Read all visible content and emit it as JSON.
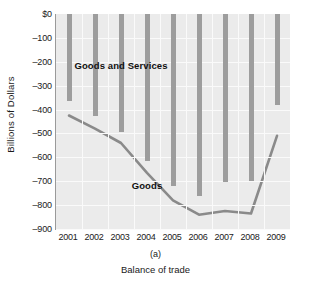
{
  "chart_data": {
    "type": "bar",
    "title": "",
    "subtitle": "",
    "panel_label": "(a)",
    "caption": "Balance of trade",
    "xlabel": "",
    "ylabel": "Billions of Dollars",
    "categories": [
      "2001",
      "2002",
      "2003",
      "2004",
      "2005",
      "2006",
      "2007",
      "2008",
      "2009"
    ],
    "ylim": [
      -900,
      0
    ],
    "ytick_labels": [
      "$0",
      "–100",
      "–200",
      "–300",
      "–400",
      "–500",
      "–600",
      "–700",
      "–800",
      "–900"
    ],
    "ytick_values": [
      0,
      -100,
      -200,
      -300,
      -400,
      -500,
      -600,
      -700,
      -800,
      -900
    ],
    "grid": true,
    "legend_position": "inline-annotations",
    "series": [
      {
        "name": "Goods and Services",
        "type": "bar",
        "color": "#9d9d9d",
        "values": [
          -365,
          -425,
          -495,
          -615,
          -720,
          -760,
          -705,
          -700,
          -380
        ]
      },
      {
        "name": "Goods",
        "type": "line",
        "color": "#8a8a8a",
        "values": [
          -425,
          -480,
          -540,
          -665,
          -780,
          -840,
          -825,
          -835,
          -510
        ]
      }
    ],
    "annotations": [
      {
        "text": "Goods and Services",
        "x_category": "2003",
        "y_value": -215
      },
      {
        "text": "Goods",
        "x_category": "2004",
        "y_value": -715
      }
    ],
    "plot_background": "#ebebeb",
    "axis_color": "#9a9a9a"
  }
}
